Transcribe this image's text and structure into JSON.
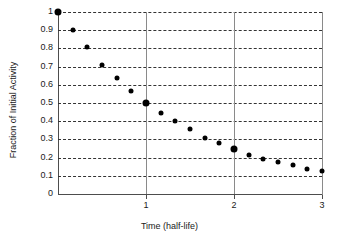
{
  "chart_data": {
    "type": "scatter",
    "title": "",
    "xlabel": "Time (half-life)",
    "ylabel": "Fraction of Initial Activity",
    "xlim": [
      0,
      3
    ],
    "ylim": [
      0,
      1
    ],
    "xticks": [
      "1",
      "2",
      "3"
    ],
    "xtick_values": [
      1,
      2,
      3
    ],
    "yticks": [
      "0",
      "0.1",
      "0.2",
      "0.3",
      "0.4",
      "0.5",
      "0.6",
      "0.7",
      "0.8",
      "0.9",
      "1"
    ],
    "ytick_values": [
      0,
      0.1,
      0.2,
      0.3,
      0.4,
      0.5,
      0.6,
      0.7,
      0.8,
      0.9,
      1
    ],
    "grid": "horizontal-dashed-plus-vertical-solid-at-1-and-2",
    "legend": "none",
    "x": [
      0,
      0.167,
      0.333,
      0.5,
      0.667,
      0.833,
      1.0,
      1.167,
      1.333,
      1.5,
      1.667,
      1.833,
      2.0,
      2.167,
      2.333,
      2.5,
      2.667,
      2.833,
      3.0
    ],
    "values": [
      1.0,
      0.9,
      0.81,
      0.71,
      0.635,
      0.565,
      0.5,
      0.445,
      0.4,
      0.355,
      0.31,
      0.28,
      0.245,
      0.215,
      0.195,
      0.175,
      0.16,
      0.14,
      0.125
    ],
    "emphasized_points": [
      0,
      6,
      12
    ],
    "annotations": []
  },
  "axes": {
    "y_title": "Fraction of Initial Activity",
    "x_title": "Time (half-life)"
  }
}
